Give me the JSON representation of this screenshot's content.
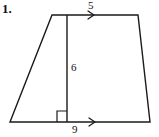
{
  "figure": {
    "problem_number": "1.",
    "shape": "trapezoid",
    "stroke_color": "#1a1a1a",
    "background_color": "#ffffff",
    "labels": {
      "top_side": "5",
      "height": "6",
      "bottom_side": "9"
    },
    "markers": {
      "right_angle": "right-angle-square",
      "parallel_top": "single-chevron-arrow",
      "parallel_bottom": "single-chevron-arrow"
    },
    "vertices": {
      "bottom_left": [
        10,
        122
      ],
      "top_left": [
        52,
        15
      ],
      "top_right": [
        138,
        15
      ],
      "bottom_right": [
        150,
        122
      ]
    },
    "height_line": {
      "x": 67,
      "y_top": 15,
      "y_bottom": 122
    }
  }
}
